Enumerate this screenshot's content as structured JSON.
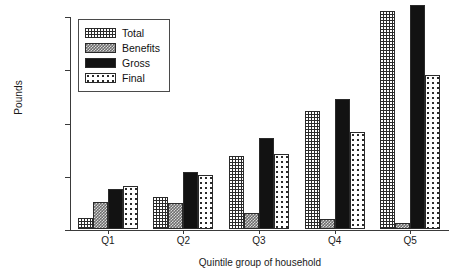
{
  "chart_data": {
    "type": "bar",
    "title": "",
    "xlabel": "Quintile group of household",
    "ylabel": "Pounds",
    "categories": [
      "Q1",
      "Q2",
      "Q3",
      "Q4",
      "Q5"
    ],
    "ylim": [
      0,
      40000
    ],
    "yticks": [
      0,
      10000,
      20000,
      30000,
      40000
    ],
    "ytick_labels": [
      "0",
      "10 000",
      "20 000",
      "30 000",
      "40 000"
    ],
    "grid": false,
    "legend_position": "upper-left-inside",
    "series": [
      {
        "name": "Total",
        "pattern": "dark-checkered",
        "color": "#2b2b2b",
        "values": [
          2000,
          6000,
          13700,
          22200,
          41000
        ]
      },
      {
        "name": "Benefits",
        "pattern": "gray-checker",
        "color": "#6e6e6e",
        "values": [
          5000,
          4800,
          3100,
          1900,
          1100
        ]
      },
      {
        "name": "Gross",
        "pattern": "solid-black",
        "color": "#121212",
        "values": [
          7500,
          10800,
          17100,
          24400,
          42000
        ]
      },
      {
        "name": "Final",
        "pattern": "white-dotted",
        "color": "#ffffff",
        "values": [
          8000,
          10200,
          14000,
          18200,
          29000
        ]
      }
    ]
  },
  "legend": {
    "items": [
      {
        "label": "Total"
      },
      {
        "label": "Benefits"
      },
      {
        "label": "Gross"
      },
      {
        "label": "Final"
      }
    ]
  },
  "axes": {
    "y_title": "Pounds",
    "x_title": "Quintile group of household"
  }
}
